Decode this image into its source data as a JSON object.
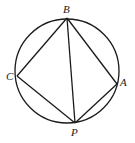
{
  "diagram": {
    "circle": {
      "cx": 67,
      "cy": 71,
      "r": 52
    },
    "points": [
      {
        "name": "B",
        "x": 67,
        "y": 18,
        "label_x": 64,
        "label_y": 13
      },
      {
        "name": "C",
        "x": 17,
        "y": 76,
        "label_x": 6,
        "label_y": 80
      },
      {
        "name": "A",
        "x": 117,
        "y": 84,
        "label_x": 121,
        "label_y": 85
      },
      {
        "name": "P",
        "x": 75,
        "y": 123,
        "label_x": 71,
        "label_y": 136
      }
    ],
    "segments": [
      [
        "B",
        "C"
      ],
      [
        "B",
        "A"
      ],
      [
        "B",
        "P"
      ],
      [
        "C",
        "P"
      ],
      [
        "A",
        "P"
      ]
    ],
    "labels": {
      "B": "B",
      "C": "C",
      "A": "A",
      "P": "P"
    }
  }
}
